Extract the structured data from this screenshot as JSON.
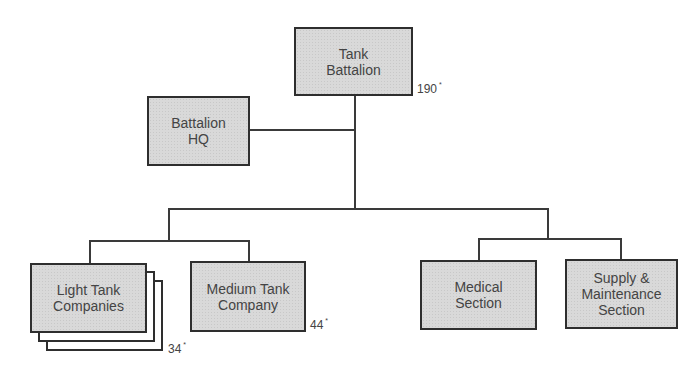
{
  "diagram": {
    "type": "organization-chart",
    "colors": {
      "box_fill": "#d9d9d9",
      "border": "#2e2e2e",
      "line": "#3a3a3a",
      "text": "#444444"
    },
    "nodes": {
      "tank_battalion": {
        "label": "Tank\nBattalion",
        "count": "190",
        "count_mark": "*"
      },
      "battalion_hq": {
        "label": "Battalion\nHQ"
      },
      "light_tank_companies": {
        "label": "Light Tank\nCompanies",
        "count": "34",
        "count_mark": "*",
        "stacked": 3
      },
      "medium_tank_company": {
        "label": "Medium Tank\nCompany",
        "count": "44",
        "count_mark": "*"
      },
      "medical_section": {
        "label": "Medical\nSection"
      },
      "supply_maintenance_section": {
        "label": "Supply &\nMaintenance\nSection"
      }
    },
    "edges": [
      [
        "tank_battalion",
        "battalion_hq"
      ],
      [
        "tank_battalion",
        "light_tank_companies"
      ],
      [
        "tank_battalion",
        "medium_tank_company"
      ],
      [
        "tank_battalion",
        "medical_section"
      ],
      [
        "tank_battalion",
        "supply_maintenance_section"
      ]
    ]
  }
}
